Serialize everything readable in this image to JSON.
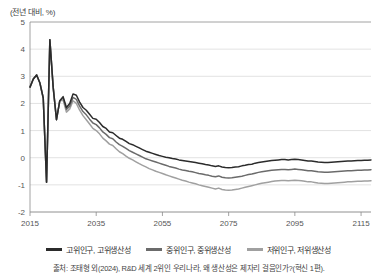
{
  "chart_data": {
    "type": "line",
    "title": "",
    "subtitle": "",
    "unit_label": "(전년 대비, %)",
    "xlabel": "",
    "ylabel": "",
    "xlim": [
      2015,
      2118
    ],
    "ylim": [
      -2,
      5
    ],
    "xticks": [
      2015,
      2035,
      2055,
      2075,
      2095,
      2115
    ],
    "xtick_labels": [
      "2015",
      "2035",
      "2055",
      "2075",
      "2095",
      "2115"
    ],
    "yticks": [
      -2,
      -1,
      0,
      1,
      2,
      3,
      4,
      5
    ],
    "ytick_labels": [
      "-2",
      "-1",
      "0",
      "1",
      "2",
      "3",
      "4",
      "5"
    ],
    "grid": true,
    "legend_position": "bottom",
    "colors": {
      "high": "#2b2b2b",
      "mid": "#6b6b6b",
      "low": "#a0a0a0",
      "grid": "#d6d6d6",
      "axis": "#8c8c8c"
    },
    "series": [
      {
        "name": "고위인구, 고위생산성",
        "color": "#2b2b2b",
        "x": [
          2015,
          2016,
          2017,
          2018,
          2019,
          2020,
          2021,
          2022,
          2023,
          2024,
          2025,
          2026,
          2027,
          2028,
          2029,
          2030,
          2031,
          2032,
          2033,
          2034,
          2035,
          2036,
          2037,
          2038,
          2039,
          2040,
          2041,
          2042,
          2043,
          2044,
          2045,
          2046,
          2047,
          2048,
          2049,
          2050,
          2051,
          2052,
          2053,
          2054,
          2055,
          2056,
          2057,
          2058,
          2059,
          2060,
          2061,
          2062,
          2063,
          2064,
          2065,
          2066,
          2067,
          2068,
          2069,
          2070,
          2071,
          2072,
          2073,
          2074,
          2075,
          2076,
          2077,
          2078,
          2079,
          2080,
          2081,
          2082,
          2083,
          2084,
          2085,
          2086,
          2087,
          2088,
          2089,
          2090,
          2091,
          2092,
          2093,
          2094,
          2095,
          2096,
          2097,
          2098,
          2099,
          2100,
          2101,
          2102,
          2103,
          2104,
          2105,
          2106,
          2107,
          2108,
          2109,
          2110,
          2111,
          2112,
          2113,
          2114,
          2115,
          2116,
          2117,
          2118
        ],
        "y": [
          2.6,
          2.9,
          3.05,
          2.75,
          2.2,
          -0.9,
          4.35,
          2.6,
          1.4,
          2.1,
          2.25,
          1.85,
          2.0,
          2.35,
          2.3,
          2.05,
          1.85,
          1.75,
          1.6,
          1.45,
          1.42,
          1.3,
          1.15,
          1.08,
          0.95,
          0.92,
          0.82,
          0.72,
          0.68,
          0.6,
          0.52,
          0.48,
          0.42,
          0.36,
          0.3,
          0.24,
          0.2,
          0.16,
          0.12,
          0.08,
          0.05,
          0.02,
          0.0,
          -0.03,
          -0.05,
          -0.08,
          -0.1,
          -0.12,
          -0.14,
          -0.16,
          -0.18,
          -0.2,
          -0.22,
          -0.25,
          -0.27,
          -0.3,
          -0.32,
          -0.3,
          -0.34,
          -0.36,
          -0.37,
          -0.36,
          -0.34,
          -0.33,
          -0.3,
          -0.28,
          -0.25,
          -0.24,
          -0.2,
          -0.18,
          -0.16,
          -0.14,
          -0.12,
          -0.1,
          -0.09,
          -0.08,
          -0.07,
          -0.07,
          -0.08,
          -0.07,
          -0.06,
          -0.07,
          -0.08,
          -0.1,
          -0.12,
          -0.12,
          -0.14,
          -0.16,
          -0.17,
          -0.18,
          -0.18,
          -0.17,
          -0.16,
          -0.15,
          -0.14,
          -0.13,
          -0.12,
          -0.12,
          -0.11,
          -0.1,
          -0.1,
          -0.09,
          -0.09,
          -0.08
        ]
      },
      {
        "name": "중위인구, 중위생산성",
        "color": "#6b6b6b",
        "x": [
          2015,
          2016,
          2017,
          2018,
          2019,
          2020,
          2021,
          2022,
          2023,
          2024,
          2025,
          2026,
          2027,
          2028,
          2029,
          2030,
          2031,
          2032,
          2033,
          2034,
          2035,
          2036,
          2037,
          2038,
          2039,
          2040,
          2041,
          2042,
          2043,
          2044,
          2045,
          2046,
          2047,
          2048,
          2049,
          2050,
          2051,
          2052,
          2053,
          2054,
          2055,
          2056,
          2057,
          2058,
          2059,
          2060,
          2061,
          2062,
          2063,
          2064,
          2065,
          2066,
          2067,
          2068,
          2069,
          2070,
          2071,
          2072,
          2073,
          2074,
          2075,
          2076,
          2077,
          2078,
          2079,
          2080,
          2081,
          2082,
          2083,
          2084,
          2085,
          2086,
          2087,
          2088,
          2089,
          2090,
          2091,
          2092,
          2093,
          2094,
          2095,
          2096,
          2097,
          2098,
          2099,
          2100,
          2101,
          2102,
          2103,
          2104,
          2105,
          2106,
          2107,
          2108,
          2109,
          2110,
          2111,
          2112,
          2113,
          2114,
          2115,
          2116,
          2117,
          2118
        ],
        "y": [
          2.6,
          2.9,
          3.05,
          2.75,
          2.2,
          -0.9,
          4.35,
          2.6,
          1.4,
          2.1,
          2.2,
          1.78,
          1.9,
          2.22,
          2.15,
          1.9,
          1.7,
          1.58,
          1.42,
          1.28,
          1.22,
          1.1,
          0.95,
          0.86,
          0.74,
          0.7,
          0.58,
          0.48,
          0.42,
          0.34,
          0.26,
          0.2,
          0.14,
          0.08,
          0.02,
          -0.04,
          -0.08,
          -0.12,
          -0.16,
          -0.2,
          -0.24,
          -0.28,
          -0.32,
          -0.35,
          -0.38,
          -0.42,
          -0.45,
          -0.47,
          -0.5,
          -0.52,
          -0.55,
          -0.58,
          -0.6,
          -0.63,
          -0.65,
          -0.68,
          -0.7,
          -0.67,
          -0.72,
          -0.74,
          -0.75,
          -0.74,
          -0.72,
          -0.7,
          -0.68,
          -0.65,
          -0.62,
          -0.6,
          -0.57,
          -0.54,
          -0.52,
          -0.5,
          -0.48,
          -0.46,
          -0.45,
          -0.44,
          -0.43,
          -0.43,
          -0.44,
          -0.43,
          -0.42,
          -0.43,
          -0.44,
          -0.46,
          -0.48,
          -0.48,
          -0.5,
          -0.52,
          -0.53,
          -0.54,
          -0.54,
          -0.53,
          -0.52,
          -0.51,
          -0.5,
          -0.49,
          -0.48,
          -0.48,
          -0.47,
          -0.46,
          -0.46,
          -0.45,
          -0.45,
          -0.44
        ]
      },
      {
        "name": "저위인구, 저위생산성",
        "color": "#a0a0a0",
        "x": [
          2015,
          2016,
          2017,
          2018,
          2019,
          2020,
          2021,
          2022,
          2023,
          2024,
          2025,
          2026,
          2027,
          2028,
          2029,
          2030,
          2031,
          2032,
          2033,
          2034,
          2035,
          2036,
          2037,
          2038,
          2039,
          2040,
          2041,
          2042,
          2043,
          2044,
          2045,
          2046,
          2047,
          2048,
          2049,
          2050,
          2051,
          2052,
          2053,
          2054,
          2055,
          2056,
          2057,
          2058,
          2059,
          2060,
          2061,
          2062,
          2063,
          2064,
          2065,
          2066,
          2067,
          2068,
          2069,
          2070,
          2071,
          2072,
          2073,
          2074,
          2075,
          2076,
          2077,
          2078,
          2079,
          2080,
          2081,
          2082,
          2083,
          2084,
          2085,
          2086,
          2087,
          2088,
          2089,
          2090,
          2091,
          2092,
          2093,
          2094,
          2095,
          2096,
          2097,
          2098,
          2099,
          2100,
          2101,
          2102,
          2103,
          2104,
          2105,
          2106,
          2107,
          2108,
          2109,
          2110,
          2111,
          2112,
          2113,
          2114,
          2115,
          2116,
          2117,
          2118
        ],
        "y": [
          2.6,
          2.9,
          3.05,
          2.75,
          2.2,
          -0.9,
          4.35,
          2.6,
          1.4,
          2.1,
          2.12,
          1.68,
          1.8,
          2.1,
          2.0,
          1.75,
          1.55,
          1.4,
          1.24,
          1.08,
          1.0,
          0.88,
          0.72,
          0.62,
          0.5,
          0.45,
          0.33,
          0.22,
          0.15,
          0.06,
          -0.02,
          -0.08,
          -0.15,
          -0.22,
          -0.28,
          -0.34,
          -0.4,
          -0.45,
          -0.5,
          -0.54,
          -0.58,
          -0.63,
          -0.67,
          -0.71,
          -0.75,
          -0.79,
          -0.83,
          -0.86,
          -0.9,
          -0.93,
          -0.96,
          -1.0,
          -1.03,
          -1.06,
          -1.09,
          -1.12,
          -1.15,
          -1.12,
          -1.17,
          -1.19,
          -1.2,
          -1.19,
          -1.17,
          -1.15,
          -1.12,
          -1.09,
          -1.06,
          -1.03,
          -1.0,
          -0.97,
          -0.94,
          -0.92,
          -0.9,
          -0.88,
          -0.86,
          -0.85,
          -0.84,
          -0.84,
          -0.85,
          -0.84,
          -0.83,
          -0.84,
          -0.85,
          -0.87,
          -0.89,
          -0.89,
          -0.91,
          -0.93,
          -0.94,
          -0.95,
          -0.95,
          -0.94,
          -0.93,
          -0.92,
          -0.91,
          -0.9,
          -0.89,
          -0.89,
          -0.88,
          -0.87,
          -0.87,
          -0.86,
          -0.86,
          -0.85
        ]
      }
    ]
  },
  "legend": {
    "items": [
      {
        "label": "고위인구, 고위생산성"
      },
      {
        "label": "중위인구, 중위생산성"
      },
      {
        "label": "저위인구, 저위생산성"
      }
    ]
  },
  "source": {
    "text": "출처: 조태형 외(2024), R&D 세계 2위인 우리나라, 왜 생산성은 제자리 걸음인가?(혁신 1편)."
  }
}
